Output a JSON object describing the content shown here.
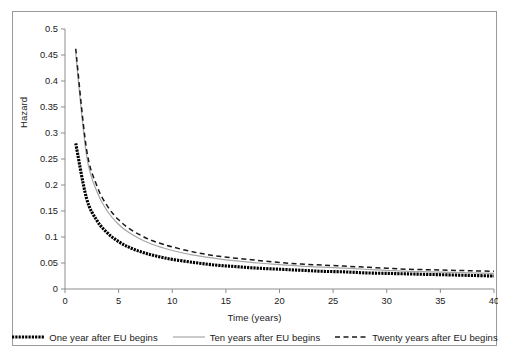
{
  "chart_data": {
    "type": "line",
    "title": "",
    "xlabel": "Time (years)",
    "ylabel": "Hazard",
    "xlim": [
      0,
      40
    ],
    "ylim": [
      0,
      0.5
    ],
    "xticks": [
      "0",
      "5",
      "10",
      "15",
      "20",
      "25",
      "30",
      "35",
      "40"
    ],
    "yticks": [
      "0",
      "0.05",
      "0.1",
      "0.15",
      "0.2",
      "0.25",
      "0.3",
      "0.35",
      "0.4",
      "0.45",
      "0.5"
    ],
    "grid": false,
    "legend_position": "bottom",
    "x": [
      1,
      2,
      3,
      4,
      5,
      6,
      7,
      8,
      9,
      10,
      12,
      14,
      16,
      18,
      20,
      22,
      24,
      26,
      28,
      30,
      32,
      34,
      36,
      38,
      40
    ],
    "series": [
      {
        "name": "One year after EU begins",
        "style": "thick-dotted",
        "color": "#000000",
        "values": [
          0.28,
          0.175,
          0.131,
          0.107,
          0.091,
          0.08,
          0.072,
          0.066,
          0.061,
          0.057,
          0.051,
          0.046,
          0.043,
          0.04,
          0.038,
          0.036,
          0.034,
          0.033,
          0.031,
          0.03,
          0.029,
          0.028,
          0.027,
          0.026,
          0.025
        ]
      },
      {
        "name": "Ten years after EU begins",
        "style": "thin-solid",
        "color": "#a6a6a6",
        "values": [
          0.452,
          0.258,
          0.186,
          0.148,
          0.124,
          0.108,
          0.096,
          0.087,
          0.08,
          0.074,
          0.065,
          0.059,
          0.054,
          0.05,
          0.047,
          0.044,
          0.042,
          0.04,
          0.038,
          0.036,
          0.034,
          0.033,
          0.032,
          0.031,
          0.03
        ]
      },
      {
        "name": "Twenty years after EU begins",
        "style": "dashed",
        "color": "#1a1a1a",
        "values": [
          0.462,
          0.27,
          0.197,
          0.158,
          0.133,
          0.116,
          0.104,
          0.094,
          0.087,
          0.081,
          0.071,
          0.064,
          0.059,
          0.055,
          0.051,
          0.048,
          0.046,
          0.044,
          0.042,
          0.04,
          0.038,
          0.037,
          0.036,
          0.035,
          0.034
        ]
      }
    ]
  },
  "legend": {
    "items": [
      {
        "label": "One year after EU begins"
      },
      {
        "label": "Ten years after EU begins"
      },
      {
        "label": "Twenty years after EU begins"
      }
    ]
  },
  "axes": {
    "y_title": "Hazard",
    "x_title": "Time (years)"
  }
}
